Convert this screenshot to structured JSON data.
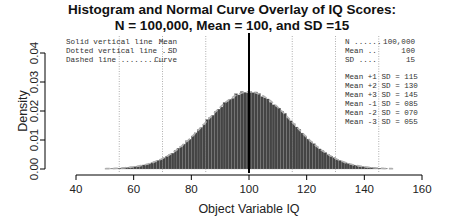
{
  "chart_data": {
    "type": "bar",
    "subtype": "histogram_with_normal_curve",
    "title": "Histogram and Normal Curve Overlay of IQ Scores:",
    "subtitle": "N = 100,000, Mean = 100, and SD =15",
    "xlabel": "Object Variable IQ",
    "ylabel": "Density",
    "xlim": [
      40,
      160
    ],
    "ylim": [
      0,
      0.04
    ],
    "x_ticks": [
      40,
      60,
      80,
      100,
      120,
      140,
      160
    ],
    "x_tick_labels": [
      "40",
      "60",
      "80",
      "100",
      "120",
      "140",
      "160"
    ],
    "y_ticks": [
      0,
      0.01,
      0.02,
      0.03,
      0.04
    ],
    "y_tick_labels": [
      "0.00",
      "0.01",
      "0.02",
      "0.03",
      "0.04"
    ],
    "grid": false,
    "distribution": {
      "n": 100000,
      "mean": 100,
      "sd": 15
    },
    "histogram": {
      "bin_width": 1,
      "range": [
        52,
        148
      ],
      "bar_color": "#444444",
      "edge_color": "#888888"
    },
    "normal_curve": {
      "style": "dashed",
      "color": "#aaaaaa",
      "range": [
        50,
        150
      ],
      "peak_density": 0.0266
    },
    "mean_line": {
      "x": 100,
      "style": "solid",
      "color": "#000000"
    },
    "sd_lines": {
      "x": [
        55,
        70,
        85,
        115,
        130,
        145
      ],
      "style": "dotted",
      "color": "#999999"
    },
    "legend_left": [
      {
        "line": "Solid vertical line",
        "dots": " .. ",
        "meaning": "Mean"
      },
      {
        "line": "Dotted vertical line",
        "dots": " .. ",
        "meaning": "SD"
      },
      {
        "line": "Dashed line",
        "dots": " .......... ",
        "meaning": "Curve"
      }
    ],
    "legend_right_stats": [
      {
        "label": "N",
        "dots": " ......",
        "value": "100,000"
      },
      {
        "label": "Mean",
        "dots": " ..",
        "value": "100"
      },
      {
        "label": "SD",
        "dots": " ....",
        "value": "15"
      }
    ],
    "legend_right_sd": [
      {
        "label": "Mean +1 SD = 115"
      },
      {
        "label": "Mean +2 SD = 130"
      },
      {
        "label": "Mean +3 SD = 145"
      },
      {
        "label": "Mean -1 SD = 085"
      },
      {
        "label": "Mean -2 SD = 070"
      },
      {
        "label": "Mean -3 SD = 055"
      }
    ]
  }
}
